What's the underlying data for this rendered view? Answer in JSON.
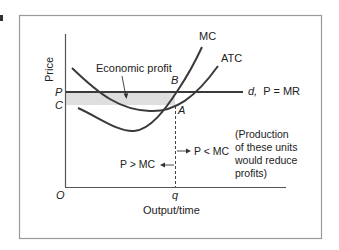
{
  "panel_marker": "a",
  "axes": {
    "y_label": "Price",
    "x_label": "Output/time",
    "origin_label": "O",
    "y_ticks": [
      {
        "label": "P",
        "meaning": "price"
      },
      {
        "label": "C",
        "meaning": "average total cost at q"
      }
    ],
    "x_ticks": [
      {
        "label": "q",
        "meaning": "profit-maximizing output"
      }
    ]
  },
  "curves": {
    "mc": {
      "label": "MC"
    },
    "atc": {
      "label": "ATC"
    },
    "demand": {
      "label_d": "d,",
      "label_eq": "P = MR"
    }
  },
  "points": {
    "b": "B",
    "a": "A"
  },
  "annotations": {
    "economic_profit": "Economic profit",
    "left_arrow": "P > MC",
    "right_arrow": "P < MC",
    "note_lines": [
      "(Production",
      "of these units",
      "would reduce",
      "profits)"
    ]
  },
  "colors": {
    "curve": "#3a3a3a",
    "profit_area": "#dedede",
    "frame": "#9a9a9a",
    "text": "#222222"
  }
}
